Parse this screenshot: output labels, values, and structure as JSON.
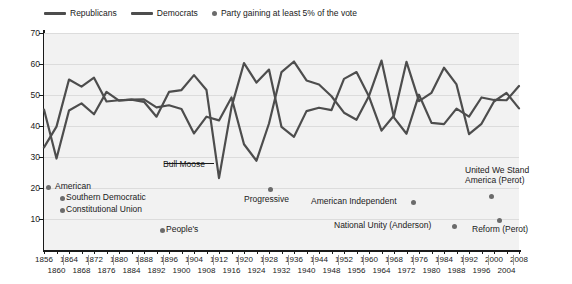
{
  "legend": {
    "items": [
      {
        "label": "Republicans",
        "marker": "line"
      },
      {
        "label": "Democrats",
        "marker": "line"
      },
      {
        "label": "Party gaining at least 5% of the vote",
        "marker": "dot"
      }
    ]
  },
  "colors": {
    "line": "#4d4d4d",
    "dot": "#6b6b6b",
    "plot_background": "#f2f2f2",
    "gridline": "#dcdcdc",
    "axis": "#1a1a1a"
  },
  "annotations": [
    {
      "label": "American",
      "year": 1856,
      "value": 21.5,
      "align": "right-of-dot"
    },
    {
      "label": "Southern Democratic",
      "year": 1860,
      "value": 18.1,
      "align": "right-of-dot"
    },
    {
      "label": "Constitutional Union",
      "year": 1860,
      "value": 12.6,
      "align": "right-of-dot"
    },
    {
      "label": "People's",
      "year": 1892,
      "value": 8.5,
      "align": "right-of-dot"
    },
    {
      "label": "Bull Moose",
      "year": 1912,
      "value": 27.4,
      "align": "leader-line"
    },
    {
      "label": "Progressive",
      "year": 1924,
      "value": 16.6,
      "align": "below-dot"
    },
    {
      "label": "American Independent",
      "year": 1968,
      "value": 13.5,
      "align": "left-of-dot"
    },
    {
      "label": "National Unity (Anderson)",
      "year": 1980,
      "value": 6.6,
      "align": "left-of-dot"
    },
    {
      "label": "United We Stand America (Perot)",
      "year": 1992,
      "value": 18.9,
      "align": "above-dot"
    },
    {
      "label": "Reform (Perot)",
      "year": 1996,
      "value": 8.4,
      "align": "below-dot"
    }
  ],
  "chart_data": {
    "type": "line",
    "title": "",
    "xlabel": "",
    "ylabel": "Percentage of the vote",
    "ylim": [
      0,
      70
    ],
    "yticks": [
      10,
      20,
      30,
      40,
      50,
      60,
      70
    ],
    "xlim": [
      1856,
      2008
    ],
    "xticks": [
      1856,
      1860,
      1864,
      1868,
      1872,
      1876,
      1880,
      1884,
      1888,
      1892,
      1896,
      1900,
      1904,
      1908,
      1912,
      1916,
      1920,
      1924,
      1928,
      1932,
      1936,
      1940,
      1944,
      1948,
      1952,
      1956,
      1960,
      1964,
      1968,
      1972,
      1976,
      1980,
      1984,
      1988,
      1992,
      1996,
      2000,
      2004,
      2008
    ],
    "grid": true,
    "legend_position": "top-left",
    "x": [
      1856,
      1860,
      1864,
      1868,
      1872,
      1876,
      1880,
      1884,
      1888,
      1892,
      1896,
      1900,
      1904,
      1908,
      1912,
      1916,
      1920,
      1924,
      1928,
      1932,
      1936,
      1940,
      1944,
      1948,
      1952,
      1956,
      1960,
      1964,
      1968,
      1972,
      1976,
      1980,
      1984,
      1988,
      1992,
      1996,
      2000,
      2004,
      2008
    ],
    "series": [
      {
        "name": "Republicans",
        "values": [
          33.1,
          39.8,
          55.0,
          52.7,
          55.6,
          47.9,
          48.3,
          48.5,
          47.8,
          43.0,
          51.0,
          51.6,
          56.4,
          51.6,
          23.2,
          46.1,
          60.3,
          54.0,
          58.2,
          39.7,
          36.5,
          44.8,
          45.9,
          45.1,
          55.2,
          57.4,
          49.5,
          38.5,
          43.4,
          60.7,
          48.0,
          50.7,
          58.8,
          53.4,
          37.4,
          40.7,
          47.9,
          50.7,
          45.7
        ]
      },
      {
        "name": "Democrats",
        "values": [
          45.3,
          29.5,
          45.0,
          47.3,
          43.8,
          51.0,
          48.2,
          48.5,
          48.6,
          46.0,
          46.7,
          45.5,
          37.6,
          43.0,
          41.8,
          49.2,
          34.1,
          28.8,
          40.8,
          57.4,
          60.8,
          54.7,
          53.4,
          49.6,
          44.3,
          42.0,
          49.7,
          61.1,
          42.7,
          37.5,
          50.1,
          41.0,
          40.6,
          45.6,
          43.0,
          49.2,
          48.4,
          48.3,
          52.9
        ]
      }
    ],
    "third_party_points": [
      {
        "party": "American",
        "year": 1856,
        "value": 21.5
      },
      {
        "party": "Southern Democratic",
        "year": 1860,
        "value": 18.1
      },
      {
        "party": "Constitutional Union",
        "year": 1860,
        "value": 12.6
      },
      {
        "party": "People's",
        "year": 1892,
        "value": 8.5
      },
      {
        "party": "Bull Moose",
        "year": 1912,
        "value": 27.4
      },
      {
        "party": "Progressive",
        "year": 1924,
        "value": 16.6
      },
      {
        "party": "American Independent",
        "year": 1968,
        "value": 13.5
      },
      {
        "party": "National Unity (Anderson)",
        "year": 1980,
        "value": 6.6
      },
      {
        "party": "United We Stand America (Perot)",
        "year": 1992,
        "value": 18.9
      },
      {
        "party": "Reform (Perot)",
        "year": 1996,
        "value": 8.4
      }
    ]
  }
}
